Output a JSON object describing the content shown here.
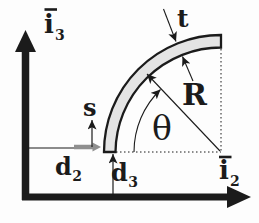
{
  "figure": {
    "ink_color": "#1b1b1b",
    "tube_fill": "#e4e4e4",
    "gray_arrow_color": "#8f8f8f",
    "labels": {
      "axis_vertical": {
        "base": "i",
        "sub": "3"
      },
      "axis_horizontal": {
        "base": "i",
        "sub": "2"
      },
      "thickness": "t",
      "radius": "R",
      "angle": "θ",
      "arc_coordinate": "s",
      "offset_horizontal": {
        "base": "d",
        "sub": "2"
      },
      "offset_vertical": {
        "base": "d",
        "sub": "3"
      }
    }
  }
}
